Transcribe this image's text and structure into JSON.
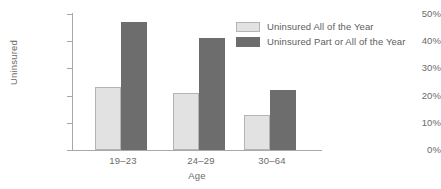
{
  "chart_data": {
    "type": "bar",
    "title": "",
    "xlabel": "Age",
    "ylabel": "Uninsured",
    "categories": [
      "19–23",
      "24–29",
      "30–64"
    ],
    "series": [
      {
        "name": "Uninsured All of the Year",
        "values": [
          23,
          41,
          13
        ],
        "color": "#e2e2e2"
      },
      {
        "name": "Uninsured Part or All of the Year",
        "values": [
          47,
          41,
          22
        ],
        "color": "#6d6d6d"
      }
    ],
    "ylim": [
      0,
      50
    ],
    "ytick_labels": [
      "0%",
      "10%",
      "20%",
      "30%",
      "40%",
      "50%"
    ],
    "ytick_values": [
      0,
      10,
      20,
      30,
      40,
      50
    ],
    "grid": false,
    "legend_position": "top-right",
    "value_unit": "percent"
  },
  "axes": {
    "y_title": "Uninsured",
    "x_title": "Age",
    "y_labels": {
      "t0": "0%",
      "t1": "10%",
      "t2": "20%",
      "t3": "30%",
      "t4": "40%",
      "t5": "50%"
    },
    "x_labels": {
      "g0": "19–23",
      "g1": "24–29",
      "g2": "30–64"
    }
  },
  "legend": {
    "items": [
      {
        "label": "Uninsured All of the Year"
      },
      {
        "label": "Uninsured Part or All of the Year"
      }
    ]
  },
  "bars": {
    "g0_light": {
      "value": 23,
      "label": "23%"
    },
    "g0_dark": {
      "value": 47,
      "label": "47%"
    },
    "g1_light": {
      "value": 21,
      "label": "21%"
    },
    "g1_dark": {
      "value": 41,
      "label": "41%"
    },
    "g2_light": {
      "value": 13,
      "label": "13%"
    },
    "g2_dark": {
      "value": 22,
      "label": "22%"
    }
  },
  "colors": {
    "series_light": "#e2e2e2",
    "series_light_border": "#b4b4b4",
    "series_dark": "#6d6d6d",
    "axis": "#a8a8a8",
    "text": "#6a6a6a",
    "background": "#ffffff"
  }
}
